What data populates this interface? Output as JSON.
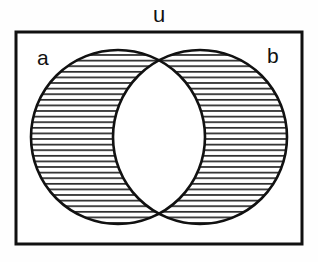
{
  "diagram": {
    "type": "venn-two-set",
    "title_label": "u",
    "set_a_label": "a",
    "set_b_label": "b",
    "shaded_region": "symmetric-difference",
    "unshaded_region": "intersection",
    "shading_style": "horizontal-hatch",
    "colors": {
      "stroke": "#111111",
      "background": "#fefefe",
      "hatch": "#1a1a1a",
      "fill_unshaded": "#ffffff"
    },
    "geometry": {
      "rect": {
        "x": 16,
        "y": 32,
        "width": 286,
        "height": 212
      },
      "circle_a": {
        "cx": 118,
        "cy": 137,
        "r": 87
      },
      "circle_b": {
        "cx": 200,
        "cy": 137,
        "r": 87
      },
      "hatch_spacing": 5.6,
      "hatch_line_width": 1.6,
      "rect_stroke_width": 3,
      "circle_stroke_width": 2.6
    }
  }
}
